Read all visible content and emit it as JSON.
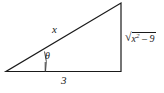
{
  "figure": {
    "type": "right-triangle-diagram",
    "background_color": "#ffffff",
    "stroke_color": "#1a1a1a",
    "labels": {
      "hypotenuse": "x",
      "base": "3",
      "angle": "θ",
      "opposite_radical_sign": "√",
      "opposite_radicand_var": "x",
      "opposite_radicand_exponent": "2",
      "opposite_radicand_operator": "–",
      "opposite_radicand_constant": "9"
    }
  }
}
